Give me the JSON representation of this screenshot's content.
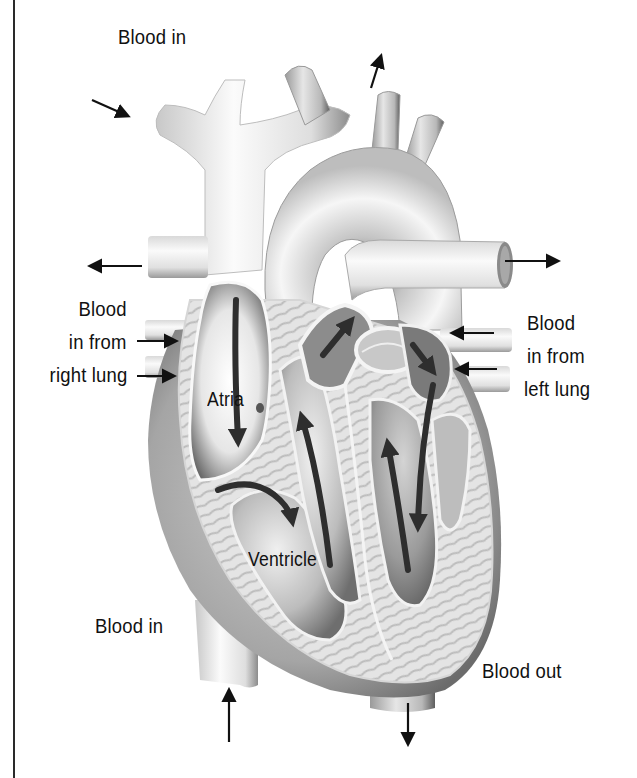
{
  "diagram": {
    "labels": {
      "blood_in_top": "Blood in",
      "right_lung_line1": "Blood",
      "right_lung_line2": "in from",
      "right_lung_line3": "right lung",
      "left_lung_line1": "Blood",
      "left_lung_line2": "in from",
      "left_lung_line3": "left lung",
      "atria": "Atria",
      "ventricle": "Ventricle",
      "blood_in_bottom": "Blood in",
      "blood_out": "Blood out"
    },
    "arrows": [
      {
        "id": "superior-vena-cava-in",
        "direction": "down-right",
        "meaning": "Blood in"
      },
      {
        "id": "aorta-out-top",
        "direction": "up",
        "meaning": "Blood out"
      },
      {
        "id": "right-pulmonary-artery-out",
        "direction": "left",
        "meaning": "Blood out to right lung"
      },
      {
        "id": "left-pulmonary-artery-out",
        "direction": "right",
        "meaning": "Blood out to left lung"
      },
      {
        "id": "right-pulmonary-vein-in-1",
        "direction": "right",
        "meaning": "Blood in from right lung"
      },
      {
        "id": "right-pulmonary-vein-in-2",
        "direction": "right",
        "meaning": "Blood in from right lung"
      },
      {
        "id": "left-pulmonary-vein-in-1",
        "direction": "left",
        "meaning": "Blood in from left lung"
      },
      {
        "id": "left-pulmonary-vein-in-2",
        "direction": "left",
        "meaning": "Blood in from left lung"
      },
      {
        "id": "inferior-vena-cava-in",
        "direction": "up",
        "meaning": "Blood in"
      },
      {
        "id": "descending-aorta-out",
        "direction": "down",
        "meaning": "Blood out"
      }
    ],
    "colors": {
      "ink": "#111111",
      "frame": "#2a2a2a",
      "tissue_light": "#f2f2f2",
      "tissue_mid": "#b8b8b8",
      "tissue_dark": "#5a5a5a",
      "flow_arrow": "#2e2e2e"
    }
  }
}
